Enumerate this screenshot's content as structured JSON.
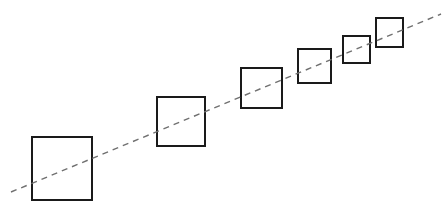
{
  "figure": {
    "title": "",
    "background_color": "#ffffff",
    "width": 448,
    "height": 214
  },
  "chart_data": {
    "type": "scatter",
    "title": "",
    "xlabel": "",
    "ylabel": "",
    "xlim": [
      0,
      448
    ],
    "ylim": [
      0,
      214
    ],
    "grid": false,
    "legend": null,
    "annotations": [],
    "marker_shape": "square-outline",
    "marker_stroke_color": "#1a1a1a",
    "marker_fill_color": "none",
    "marker_stroke_width": 2,
    "categories": [
      "1",
      "2",
      "3",
      "4",
      "5",
      "6"
    ],
    "series": [
      {
        "name": "squares",
        "label": "Square size sequence",
        "values": [
          60,
          48,
          41,
          33,
          27,
          27
        ],
        "points": [
          {
            "index": 1,
            "x": 32,
            "y": 137,
            "width": 60,
            "height": 63,
            "center_x": 62,
            "center_y": 168.5
          },
          {
            "index": 2,
            "x": 157,
            "y": 97,
            "width": 48,
            "height": 49,
            "center_x": 181,
            "center_y": 121.5
          },
          {
            "index": 3,
            "x": 241,
            "y": 68,
            "width": 41,
            "height": 40,
            "center_x": 261.5,
            "center_y": 88
          },
          {
            "index": 4,
            "x": 298,
            "y": 49,
            "width": 33,
            "height": 34,
            "center_x": 314.5,
            "center_y": 66
          },
          {
            "index": 5,
            "x": 343,
            "y": 36,
            "width": 27,
            "height": 27,
            "center_x": 356.5,
            "center_y": 49.5
          },
          {
            "index": 6,
            "x": 376,
            "y": 18,
            "width": 27,
            "height": 29,
            "center_x": 389.5,
            "center_y": 32.5
          }
        ]
      }
    ],
    "trend_line": {
      "name": "trend-line",
      "label": "",
      "style": "dashed",
      "color": "#707070",
      "stroke_width": 1.4,
      "dash_pattern": "6 5",
      "x1": 11,
      "y1": 192,
      "x2": 441,
      "y2": 14
    }
  }
}
